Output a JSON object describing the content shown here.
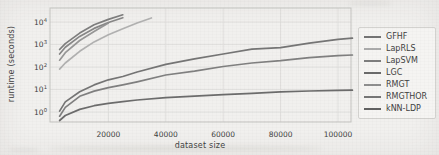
{
  "chart_data": {
    "type": "line",
    "title": "",
    "xlabel": "dataset size",
    "ylabel": "runtime (seconds)",
    "y_scale": "log",
    "grid": true,
    "legend_position": "right-outside",
    "xlim": [
      0,
      105000
    ],
    "ylim": [
      0.36,
      42000
    ],
    "x_ticks": [
      {
        "value": 20000,
        "label": "20000"
      },
      {
        "value": 40000,
        "label": "40000"
      },
      {
        "value": 60000,
        "label": "60000"
      },
      {
        "value": 80000,
        "label": "80000"
      },
      {
        "value": 100000,
        "label": "100000"
      }
    ],
    "y_ticks": [
      {
        "exponent": "0",
        "base": "10"
      },
      {
        "exponent": "1",
        "base": "10"
      },
      {
        "exponent": "2",
        "base": "10"
      },
      {
        "exponent": "3",
        "base": "10"
      },
      {
        "exponent": "4",
        "base": "10"
      }
    ],
    "series": [
      {
        "name": "GFHF",
        "color": "#747474",
        "points": [
          [
            3000,
            600
          ],
          [
            5000,
            1100
          ],
          [
            10000,
            3200
          ],
          [
            15000,
            7500
          ],
          [
            20000,
            13000
          ],
          [
            25000,
            21000
          ]
        ]
      },
      {
        "name": "LapRLS",
        "color": "#ababab",
        "points": [
          [
            3000,
            80
          ],
          [
            5000,
            150
          ],
          [
            10000,
            500
          ],
          [
            15000,
            1300
          ],
          [
            20000,
            2700
          ],
          [
            25000,
            5000
          ],
          [
            30000,
            9000
          ],
          [
            35000,
            15000
          ]
        ]
      },
      {
        "name": "LapSVM",
        "color": "#7e7e7e",
        "points": [
          [
            3000,
            380
          ],
          [
            5000,
            750
          ],
          [
            10000,
            2300
          ],
          [
            15000,
            5200
          ],
          [
            20000,
            9500
          ],
          [
            25000,
            15500
          ]
        ]
      },
      {
        "name": "LGC",
        "color": "#6a6a6a",
        "points": [
          [
            3000,
            1.1
          ],
          [
            5000,
            2.8
          ],
          [
            10000,
            8
          ],
          [
            15000,
            16
          ],
          [
            20000,
            27
          ],
          [
            25000,
            38
          ],
          [
            30000,
            60
          ],
          [
            40000,
            130
          ],
          [
            50000,
            230
          ],
          [
            60000,
            380
          ],
          [
            70000,
            620
          ],
          [
            80000,
            720
          ],
          [
            90000,
            1150
          ],
          [
            100000,
            1700
          ],
          [
            105000,
            1900
          ]
        ]
      },
      {
        "name": "RMGT",
        "color": "#8f8f8f",
        "points": [
          [
            3000,
            200
          ],
          [
            5000,
            430
          ],
          [
            10000,
            1500
          ],
          [
            15000,
            3800
          ],
          [
            20000,
            9000
          ]
        ]
      },
      {
        "name": "RMGTHOR",
        "color": "#767676",
        "points": [
          [
            3000,
            0.65
          ],
          [
            5000,
            1.6
          ],
          [
            10000,
            5
          ],
          [
            15000,
            8.5
          ],
          [
            20000,
            12
          ],
          [
            25000,
            16
          ],
          [
            30000,
            22
          ],
          [
            40000,
            44
          ],
          [
            50000,
            65
          ],
          [
            60000,
            105
          ],
          [
            70000,
            150
          ],
          [
            80000,
            190
          ],
          [
            90000,
            260
          ],
          [
            100000,
            320
          ],
          [
            105000,
            340
          ]
        ]
      },
      {
        "name": "kNN-LDP",
        "color": "#616161",
        "points": [
          [
            3000,
            0.42
          ],
          [
            5000,
            0.7
          ],
          [
            10000,
            1.3
          ],
          [
            15000,
            1.9
          ],
          [
            20000,
            2.4
          ],
          [
            25000,
            2.9
          ],
          [
            30000,
            3.4
          ],
          [
            40000,
            4.3
          ],
          [
            50000,
            5.1
          ],
          [
            60000,
            5.9
          ],
          [
            70000,
            6.8
          ],
          [
            80000,
            7.8
          ],
          [
            90000,
            8.6
          ],
          [
            100000,
            9.1
          ],
          [
            105000,
            9.3
          ]
        ]
      }
    ]
  },
  "style": {
    "paper_bg": "#f1f0ee",
    "grid_color": "#dfdedb",
    "border_color": "#c4c3c0",
    "text_color": "#3f3f3f",
    "legend_bg": "#f5f4f2",
    "legend_border": "#d3d2cf"
  }
}
